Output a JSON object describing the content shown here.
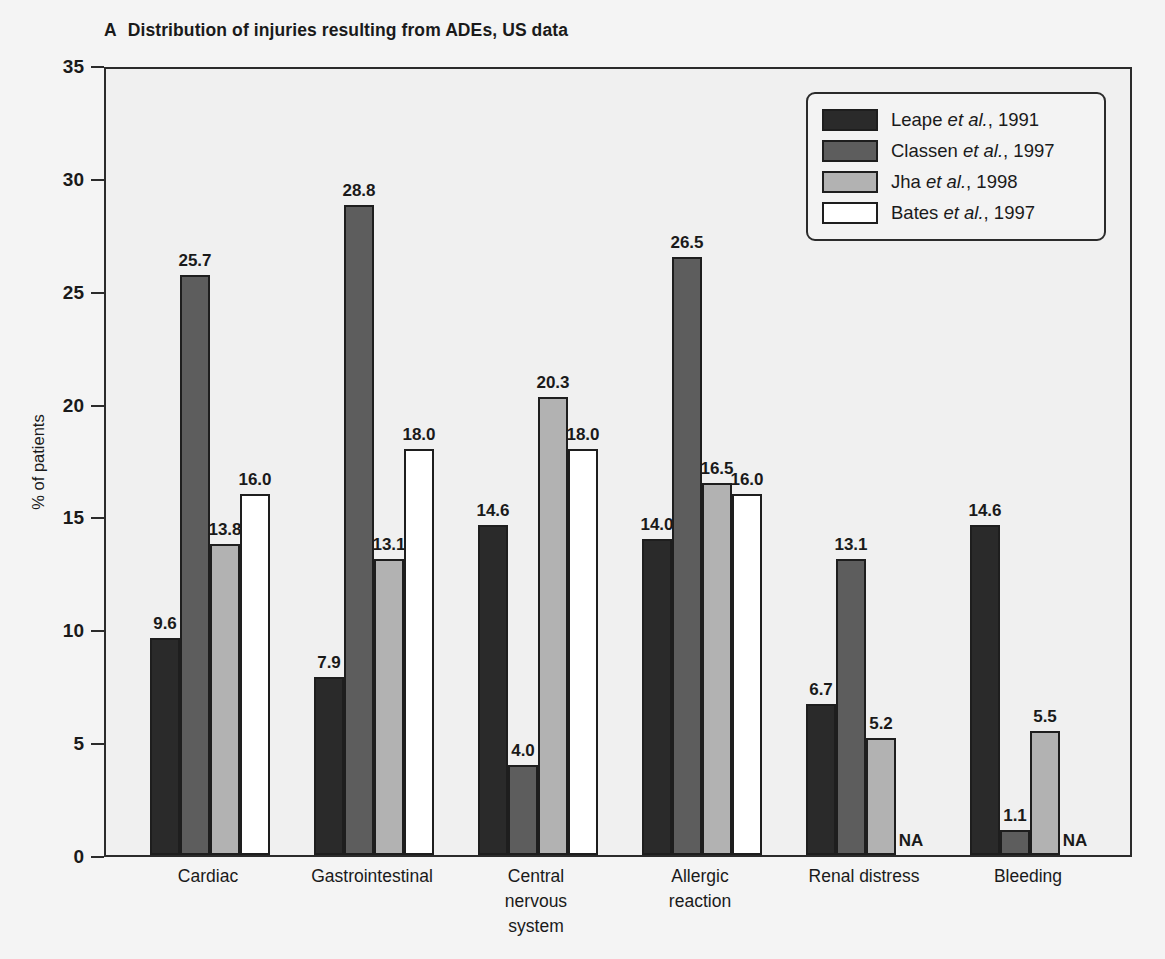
{
  "figure": {
    "panel_letter": "A",
    "title": "Distribution of injuries resulting from ADEs, US data"
  },
  "legend": {
    "position": "top-right",
    "items": [
      {
        "label": "Leape et al., 1991",
        "name": "Leape",
        "italic": "et al.",
        "prefix": "Leape ",
        "suffix": ", 1991",
        "color": "#2a2a2a"
      },
      {
        "label": "Classen et al., 1997",
        "name": "Classen",
        "italic": "et al.",
        "prefix": "Classen ",
        "suffix": ", 1997",
        "color": "#5d5d5d"
      },
      {
        "label": "Jha et al., 1998",
        "name": "Jha",
        "italic": "et al.",
        "prefix": "Jha ",
        "suffix": ", 1998",
        "color": "#b2b2b2"
      },
      {
        "label": "Bates et al., 1997",
        "name": "Bates",
        "italic": "et al.",
        "prefix": "Bates ",
        "suffix": ", 1997",
        "color": "#ffffff"
      }
    ]
  },
  "chart_data": {
    "type": "bar",
    "title": "Distribution of injuries resulting from ADEs, US data",
    "xlabel": "",
    "ylabel": "% of patients",
    "ylim": [
      0,
      35
    ],
    "yticks": [
      0,
      5,
      10,
      15,
      20,
      25,
      30,
      35
    ],
    "ytick_labels": [
      "0",
      "5",
      "10",
      "15",
      "20",
      "25",
      "30",
      "35"
    ],
    "grid": false,
    "legend_position": "top-right",
    "categories": [
      "Cardiac",
      "Gastrointestinal",
      "Central nervous system",
      "Allergic reaction",
      "Renal distress",
      "Bleeding"
    ],
    "category_label_lines": [
      [
        "Cardiac"
      ],
      [
        "Gastrointestinal"
      ],
      [
        "Central",
        "nervous",
        "system"
      ],
      [
        "Allergic",
        "reaction"
      ],
      [
        "Renal distress"
      ],
      [
        "Bleeding"
      ]
    ],
    "series": [
      {
        "name": "Leape et al., 1991",
        "color": "#2a2a2a",
        "values": [
          9.6,
          7.9,
          14.6,
          14.0,
          6.7,
          14.6
        ],
        "labels": [
          "9.6",
          "7.9",
          "14.6",
          "14.0",
          "6.7",
          "14.6"
        ]
      },
      {
        "name": "Classen et al., 1997",
        "color": "#5d5d5d",
        "values": [
          25.7,
          28.8,
          4.0,
          26.5,
          13.1,
          1.1
        ],
        "labels": [
          "25.7",
          "28.8",
          "4.0",
          "26.5",
          "13.1",
          "1.1"
        ]
      },
      {
        "name": "Jha et al., 1998",
        "color": "#b2b2b2",
        "values": [
          13.8,
          13.1,
          20.3,
          16.5,
          5.2,
          5.5
        ],
        "labels": [
          "13.8",
          "13.1",
          "20.3",
          "16.5",
          "5.2",
          "5.5"
        ]
      },
      {
        "name": "Bates et al., 1997",
        "color": "#ffffff",
        "values": [
          16.0,
          18.0,
          18.0,
          16.0,
          null,
          null
        ],
        "labels": [
          "16.0",
          "18.0",
          "18.0",
          "16.0",
          "NA",
          "NA"
        ]
      }
    ],
    "missing_value_text": "NA"
  },
  "colors": {
    "axis": "#2b2b2b",
    "bar_outline": "#1e1e1e",
    "plot_background": "#f0f0f0",
    "page_background": "#f4f4f4",
    "text": "#1a1a1a"
  }
}
